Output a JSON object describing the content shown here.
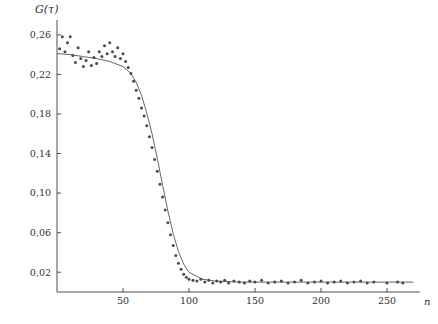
{
  "chart_data": {
    "type": "scatter",
    "title": "",
    "ylabel": "G(τ)",
    "xlabel": "n",
    "xlim": [
      0,
      275
    ],
    "ylim": [
      0,
      0.275
    ],
    "grid": false,
    "legend": null,
    "yticks": [
      0.02,
      0.06,
      0.1,
      0.14,
      0.18,
      0.22,
      0.26
    ],
    "ytick_labels": [
      "0,02",
      "0,06",
      "0,10",
      "0,14",
      "0,18",
      "0,22",
      "0,26"
    ],
    "xticks": [
      50,
      100,
      150,
      200,
      250
    ],
    "xtick_labels": [
      "50",
      "100",
      "150",
      "200",
      "250"
    ],
    "marker": "dot",
    "marker_color": "#4a4a4a",
    "line_color": "#555555",
    "series": [
      {
        "name": "G(tau) data",
        "x": [
          2,
          4,
          6,
          8,
          10,
          12,
          14,
          16,
          18,
          20,
          22,
          24,
          26,
          28,
          30,
          32,
          34,
          36,
          38,
          40,
          42,
          44,
          46,
          48,
          50,
          52,
          54,
          56,
          58,
          60,
          62,
          64,
          66,
          68,
          70,
          72,
          74,
          76,
          78,
          80,
          82,
          84,
          86,
          88,
          90,
          92,
          94,
          96,
          98,
          100,
          103,
          106,
          109,
          112,
          115,
          118,
          121,
          124,
          127,
          130,
          134,
          138,
          142,
          146,
          150,
          155,
          160,
          165,
          170,
          175,
          180,
          185,
          190,
          195,
          200,
          205,
          210,
          215,
          220,
          225,
          230,
          235,
          240,
          250,
          258,
          262
        ],
        "y": [
          0.246,
          0.258,
          0.243,
          0.252,
          0.258,
          0.239,
          0.232,
          0.247,
          0.236,
          0.228,
          0.234,
          0.243,
          0.229,
          0.237,
          0.231,
          0.243,
          0.238,
          0.249,
          0.241,
          0.252,
          0.243,
          0.238,
          0.247,
          0.236,
          0.241,
          0.233,
          0.227,
          0.221,
          0.213,
          0.204,
          0.196,
          0.186,
          0.178,
          0.168,
          0.157,
          0.146,
          0.134,
          0.122,
          0.109,
          0.096,
          0.083,
          0.07,
          0.058,
          0.047,
          0.037,
          0.029,
          0.023,
          0.018,
          0.015,
          0.013,
          0.012,
          0.011,
          0.013,
          0.01,
          0.012,
          0.009,
          0.011,
          0.01,
          0.012,
          0.009,
          0.011,
          0.01,
          0.009,
          0.011,
          0.01,
          0.012,
          0.009,
          0.01,
          0.011,
          0.009,
          0.01,
          0.012,
          0.009,
          0.01,
          0.011,
          0.009,
          0.01,
          0.011,
          0.009,
          0.01,
          0.011,
          0.009,
          0.01,
          0.009,
          0.01,
          0.009
        ]
      },
      {
        "name": "fit curve",
        "x": [
          0,
          10,
          20,
          30,
          40,
          50,
          56,
          60,
          64,
          68,
          72,
          76,
          80,
          84,
          88,
          92,
          96,
          100,
          110,
          120,
          140,
          160,
          180,
          200,
          220,
          240,
          260,
          270
        ],
        "y": [
          0.241,
          0.24,
          0.238,
          0.236,
          0.233,
          0.228,
          0.221,
          0.212,
          0.199,
          0.181,
          0.16,
          0.135,
          0.108,
          0.082,
          0.059,
          0.041,
          0.028,
          0.02,
          0.013,
          0.011,
          0.01,
          0.01,
          0.01,
          0.01,
          0.01,
          0.01,
          0.01,
          0.01
        ]
      }
    ]
  }
}
